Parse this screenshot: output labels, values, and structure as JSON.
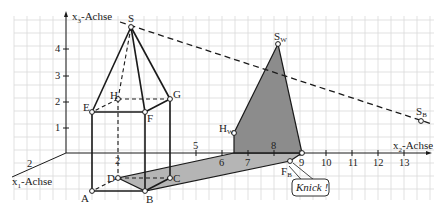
{
  "diagram": {
    "axes": {
      "x1": {
        "label": "x",
        "sub": "1",
        "suffix": "-Achse",
        "tick": "2"
      },
      "x2": {
        "label": "x",
        "sub": "2",
        "suffix": "-Achse",
        "ticks": [
          "2",
          "5",
          "6",
          "7",
          "8",
          "9",
          "10",
          "11",
          "12",
          "13"
        ]
      },
      "x3": {
        "label": "x",
        "sub": "3",
        "suffix": "-Achse",
        "ticks": [
          "1",
          "2",
          "3",
          "4"
        ]
      }
    },
    "points": {
      "A": "A",
      "B": "B",
      "C": "C",
      "D": "D",
      "E": "E",
      "F": "F",
      "G": "G",
      "H": "H",
      "S": "S",
      "SW": {
        "main": "S",
        "sub": "W"
      },
      "HW": {
        "main": "H",
        "sub": "W"
      },
      "FB": {
        "main": "F",
        "sub": "B"
      },
      "SB": {
        "main": "S",
        "sub": "B"
      }
    },
    "callout": "Knick !",
    "colors": {
      "grid": "#d6d6d6",
      "line": "#1a1a1a",
      "shadow_floor": "#b4b4b4",
      "shadow_wall": "#8a8a8a"
    }
  }
}
